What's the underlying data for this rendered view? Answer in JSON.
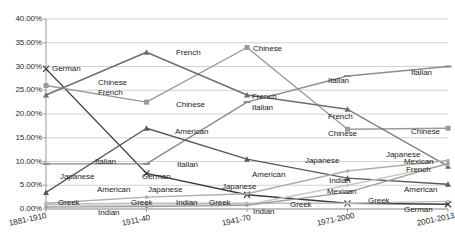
{
  "chart_data": {
    "type": "line",
    "title": "",
    "subtitle": "",
    "xlabel": "",
    "ylabel": "",
    "categories": [
      "1881-1910",
      "1911-40",
      "1941-70",
      "1971-2000",
      "2001-2013"
    ],
    "ylim": [
      0,
      40
    ],
    "ytick_labels": [
      "0.00%",
      "5.00%",
      "10.00%",
      "15.00%",
      "20.00%",
      "25.00%",
      "30.00%",
      "35.00%",
      "40.00%"
    ],
    "ytick_values": [
      0,
      5,
      10,
      15,
      20,
      25,
      30,
      35,
      40
    ],
    "grid": true,
    "legend_position": "none",
    "series": [
      {
        "name": "German",
        "values": [
          29.5,
          7.5,
          3.0,
          1.2,
          1.0
        ],
        "color": "#3a3a3a",
        "marker": "x"
      },
      {
        "name": "Chinese",
        "values": [
          26.0,
          22.5,
          34.0,
          16.8,
          17.0
        ],
        "color": "#9a9a9a",
        "marker": "square"
      },
      {
        "name": "French",
        "values": [
          24.0,
          33.0,
          24.0,
          21.0,
          9.0
        ],
        "color": "#6f6f6f",
        "marker": "triangle"
      },
      {
        "name": "Italian",
        "values": [
          9.5,
          9.5,
          22.5,
          28.0,
          30.0
        ],
        "color": "#8c8c8c",
        "marker": "dash"
      },
      {
        "name": "American",
        "values": [
          3.5,
          17.0,
          10.5,
          6.5,
          5.2
        ],
        "color": "#5a5a5a",
        "marker": "triangle"
      },
      {
        "name": "Japanese",
        "values": [
          1.2,
          2.5,
          3.2,
          8.0,
          10.2
        ],
        "color": "#aeaeae",
        "marker": "dot"
      },
      {
        "name": "Greek",
        "values": [
          1.0,
          1.2,
          1.2,
          1.2,
          1.6
        ],
        "color": "#bdbdbd",
        "marker": "dot"
      },
      {
        "name": "Indian",
        "values": [
          0.6,
          0.8,
          0.9,
          5.0,
          9.4
        ],
        "color": "#c7c7c7",
        "marker": "dot"
      },
      {
        "name": "Mexican",
        "values": [
          0.4,
          0.5,
          0.8,
          3.5,
          9.6
        ],
        "color": "#9f9f9f",
        "marker": "dot"
      }
    ],
    "point_labels": [
      {
        "text": "German",
        "x": 52,
        "y": 64,
        "series": "German",
        "category": "1881-1910"
      },
      {
        "text": "Chinese",
        "x": 98,
        "y": 78,
        "series": "Chinese",
        "category": "1881-1910"
      },
      {
        "text": "French",
        "x": 98,
        "y": 88,
        "series": "French",
        "category": "1881-1910"
      },
      {
        "text": "Italian",
        "x": 95,
        "y": 157,
        "series": "Italian",
        "category": "1881-1910"
      },
      {
        "text": "Japanese",
        "x": 60,
        "y": 172,
        "series": "Japanese",
        "category": "1881-1910"
      },
      {
        "text": "American",
        "x": 97,
        "y": 185,
        "series": "American",
        "category": "1881-1910"
      },
      {
        "text": "Greek",
        "x": 58,
        "y": 198,
        "series": "Greek",
        "category": "1881-1910"
      },
      {
        "text": "Indian",
        "x": 98,
        "y": 208,
        "series": "Indian",
        "category": "1881-1910"
      },
      {
        "text": "French",
        "x": 176,
        "y": 48,
        "series": "French",
        "category": "1911-40"
      },
      {
        "text": "Chinese",
        "x": 176,
        "y": 100,
        "series": "Chinese",
        "category": "1911-40"
      },
      {
        "text": "American",
        "x": 175,
        "y": 127,
        "series": "American",
        "category": "1911-40"
      },
      {
        "text": "German",
        "x": 142,
        "y": 172,
        "series": "German",
        "category": "1911-40"
      },
      {
        "text": "Italian",
        "x": 177,
        "y": 160,
        "series": "Italian",
        "category": "1911-40"
      },
      {
        "text": "Japanese",
        "x": 148,
        "y": 185,
        "series": "Japanese",
        "category": "1911-40"
      },
      {
        "text": "Greek",
        "x": 131,
        "y": 198,
        "series": "Greek",
        "category": "1911-40"
      },
      {
        "text": "Indian",
        "x": 176,
        "y": 198,
        "series": "Indian",
        "category": "1911-40"
      },
      {
        "text": "Chinese",
        "x": 253,
        "y": 44,
        "series": "Chinese",
        "category": "1941-70"
      },
      {
        "text": "French",
        "x": 252,
        "y": 92,
        "series": "French",
        "category": "1941-70"
      },
      {
        "text": "Italian",
        "x": 252,
        "y": 103,
        "series": "Italian",
        "category": "1941-70"
      },
      {
        "text": "American",
        "x": 252,
        "y": 170,
        "series": "American",
        "category": "1941-70"
      },
      {
        "text": "Japanese",
        "x": 222,
        "y": 182,
        "series": "Japanese",
        "category": "1941-70"
      },
      {
        "text": "Greek",
        "x": 209,
        "y": 198,
        "series": "Greek",
        "category": "1941-70"
      },
      {
        "text": "Indian",
        "x": 253,
        "y": 207,
        "series": "Indian",
        "category": "1941-70"
      },
      {
        "text": "Italian",
        "x": 328,
        "y": 76,
        "series": "Italian",
        "category": "1971-2000"
      },
      {
        "text": "French",
        "x": 328,
        "y": 112,
        "series": "French",
        "category": "1971-2000"
      },
      {
        "text": "Chinese",
        "x": 328,
        "y": 129,
        "series": "Chinese",
        "category": "1971-2000"
      },
      {
        "text": "Japanese",
        "x": 305,
        "y": 156,
        "series": "Japanese",
        "category": "1971-2000"
      },
      {
        "text": "Indian",
        "x": 329,
        "y": 176,
        "series": "Indian",
        "category": "1971-2000"
      },
      {
        "text": "Mexican",
        "x": 327,
        "y": 187,
        "series": "Mexican",
        "category": "1971-2000"
      },
      {
        "text": "Greek",
        "x": 290,
        "y": 200,
        "series": "Greek",
        "category": "1971-2000"
      },
      {
        "text": "Italian",
        "x": 411,
        "y": 68,
        "series": "Italian",
        "category": "2001-2013"
      },
      {
        "text": "Chinese",
        "x": 411,
        "y": 127,
        "series": "Chinese",
        "category": "2001-2013"
      },
      {
        "text": "Japanese",
        "x": 386,
        "y": 150,
        "series": "Japanese",
        "category": "2001-2013"
      },
      {
        "text": "Mexican",
        "x": 404,
        "y": 157,
        "series": "Mexican",
        "category": "2001-2013"
      },
      {
        "text": "French",
        "x": 406,
        "y": 165,
        "series": "French",
        "category": "2001-2013"
      },
      {
        "text": "American",
        "x": 404,
        "y": 185,
        "series": "American",
        "category": "2001-2013"
      },
      {
        "text": "Greek",
        "x": 368,
        "y": 196,
        "series": "Greek",
        "category": "2001-2013"
      },
      {
        "text": "German",
        "x": 404,
        "y": 205,
        "series": "German",
        "category": "2001-2013"
      }
    ]
  }
}
